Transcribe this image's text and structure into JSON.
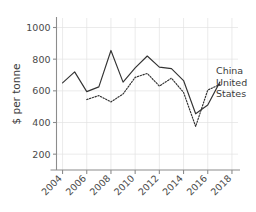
{
  "chart_data": {
    "type": "line",
    "title": "",
    "subtitle": "",
    "xlabel": "",
    "ylabel": "$ per tonne",
    "xlim": [
      2003.5,
      2018.5
    ],
    "ylim": [
      100,
      1060
    ],
    "yticks": [
      200,
      400,
      600,
      800,
      1000
    ],
    "ytick_labels": [
      "200",
      "400",
      "600",
      "800",
      "1000"
    ],
    "xticks": [
      2004,
      2006,
      2008,
      2010,
      2012,
      2014,
      2016,
      2018
    ],
    "xtick_labels": [
      "2004",
      "2006",
      "2008",
      "2010",
      "2012",
      "2014",
      "2016",
      "2018"
    ],
    "xtick_rotation_deg": 45,
    "grid": true,
    "grid_color": "#e2e2e2",
    "legend_position": "right-inline",
    "line_color": "#333333",
    "series": [
      {
        "name": "China",
        "style": "solid",
        "label": "China",
        "x": [
          2004,
          2005,
          2006,
          2007,
          2008,
          2009,
          2010,
          2011,
          2012,
          2013,
          2014,
          2015,
          2016,
          2017
        ],
        "values": [
          650,
          720,
          595,
          625,
          855,
          655,
          745,
          820,
          750,
          740,
          665,
          455,
          510,
          655
        ]
      },
      {
        "name": "United States",
        "style": "dotted",
        "label": "United States",
        "x": [
          2006,
          2007,
          2008,
          2009,
          2010,
          2011,
          2012,
          2013,
          2014,
          2015,
          2016,
          2017
        ],
        "values": [
          545,
          570,
          530,
          580,
          685,
          710,
          630,
          680,
          590,
          375,
          605,
          640
        ]
      }
    ]
  },
  "legend": {
    "entries": [
      {
        "label": "China"
      },
      {
        "label": "United"
      },
      {
        "label": "States"
      }
    ]
  },
  "axes": {
    "y_title": "$ per tonne"
  }
}
